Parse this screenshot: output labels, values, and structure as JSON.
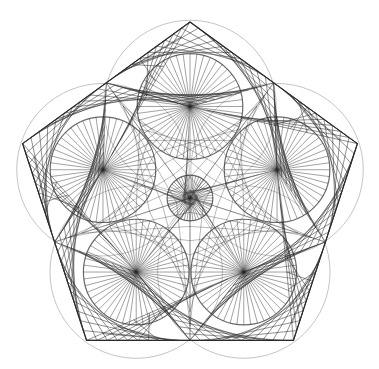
{
  "figure": {
    "background": "#ffffff",
    "line_color": "#2a2a2a",
    "guide_color": "#b5b5b5",
    "pentagon": {
      "center": [
        190,
        198
      ],
      "circumradius": 176,
      "rotation_deg": -90
    },
    "spoke_circles": {
      "count_outer": 5,
      "center_distance_ratio": 0.52,
      "radius_ratio": 0.3,
      "spokes": 48,
      "has_center_circle": true,
      "center_radius_ratio": 0.13
    },
    "guide_circles": {
      "radius_ratio": 0.49
    },
    "string_art": {
      "divisions": 10
    }
  }
}
